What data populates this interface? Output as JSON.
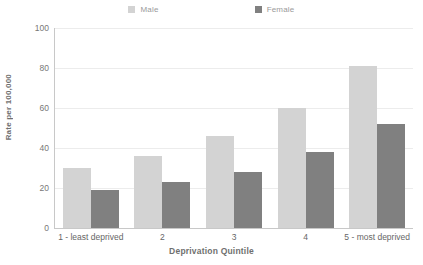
{
  "chart_data": {
    "type": "bar",
    "title": "",
    "xlabel": "Deprivation Quintile",
    "ylabel": "Rate per 100,000",
    "categories": [
      "1 - least deprived",
      "2",
      "3",
      "4",
      "5 - most deprived"
    ],
    "series": [
      {
        "name": "Male",
        "color": "#d3d3d3",
        "values": [
          30,
          36,
          46,
          60,
          81
        ]
      },
      {
        "name": "Female",
        "color": "#808080",
        "values": [
          19,
          23,
          28,
          38,
          52
        ]
      }
    ],
    "ylim": [
      0,
      100
    ],
    "yticks": [
      0,
      20,
      40,
      60,
      80,
      100
    ],
    "ytick_labels": [
      "0",
      "20",
      "40",
      "60",
      "80",
      "100"
    ],
    "grid": true,
    "legend_position": "top"
  },
  "legend": {
    "items": [
      {
        "label": "Male",
        "color": "#d3d3d3"
      },
      {
        "label": "Female",
        "color": "#808080"
      }
    ]
  },
  "colors": {
    "male": "#d3d3d3",
    "female": "#808080",
    "grid": "#ececec",
    "axis": "#c8c8c8",
    "text": "#6f6f6f",
    "background": "#ffffff"
  }
}
